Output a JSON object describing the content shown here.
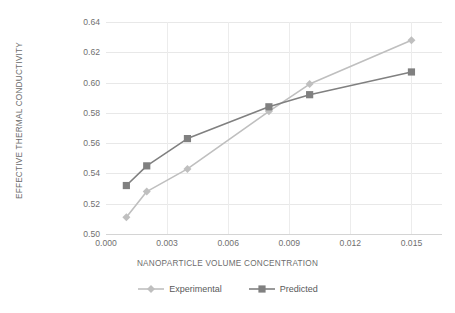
{
  "chart_data": {
    "type": "line",
    "title": "",
    "xlabel": "NANOPARTICLE VOLUME CONCENTRATION",
    "ylabel": "EFFECTIVE THERMAL CONDUCTIVITY",
    "xlim": [
      0.0,
      0.0165
    ],
    "ylim": [
      0.5,
      0.64
    ],
    "grid": true,
    "legend_position": "bottom",
    "xticks": [
      "0.000",
      "0.003",
      "0.006",
      "0.009",
      "0.012",
      "0.015"
    ],
    "xtick_values": [
      0.0,
      0.003,
      0.006,
      0.009,
      0.012,
      0.015
    ],
    "yticks": [
      "0.50",
      "0.52",
      "0.54",
      "0.56",
      "0.58",
      "0.60",
      "0.62",
      "0.64"
    ],
    "ytick_values": [
      0.5,
      0.52,
      0.54,
      0.56,
      0.58,
      0.6,
      0.62,
      0.64
    ],
    "x": [
      0.001,
      0.002,
      0.004,
      0.008,
      0.01,
      0.015
    ],
    "series": [
      {
        "name": "Experimental",
        "color": "#bfbfbf",
        "marker": "diamond",
        "values": [
          0.511,
          0.528,
          0.543,
          0.581,
          0.599,
          0.628
        ]
      },
      {
        "name": "Predicted",
        "color": "#808080",
        "marker": "square",
        "values": [
          0.532,
          0.545,
          0.563,
          0.584,
          0.592,
          0.607
        ]
      }
    ]
  },
  "legend": {
    "items": [
      {
        "label": "Experimental"
      },
      {
        "label": "Predicted"
      }
    ]
  },
  "colors": {
    "experimental": "#bfbfbf",
    "predicted": "#808080",
    "gridline": "#e8e8e8",
    "text": "#707070",
    "background": "#ffffff"
  }
}
